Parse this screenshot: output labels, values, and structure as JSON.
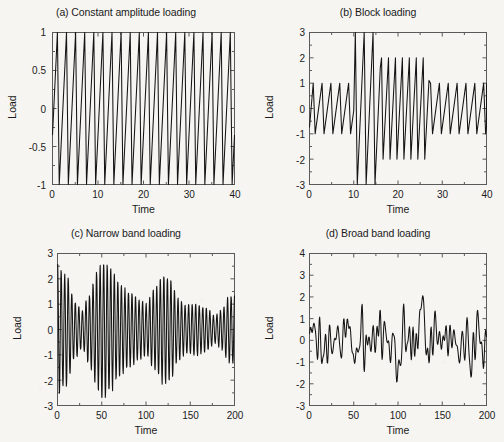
{
  "figure": {
    "background_color": "#f6f5f2",
    "line_color": "#141414",
    "axis_color": "#5a5a5a",
    "panel_count": 4
  },
  "chart_data": [
    {
      "type": "line",
      "panel": "a",
      "title": "(a) Constant amplitude loading",
      "xlabel": "Time",
      "ylabel": "Load",
      "xlim": [
        0,
        40
      ],
      "ylim": [
        -1,
        1
      ],
      "xticks": [
        0,
        10,
        20,
        30,
        40
      ],
      "yticks": [
        -1,
        -0.5,
        0,
        0.5,
        1
      ],
      "xticklabels": [
        "0",
        "10",
        "20",
        "30",
        "40"
      ],
      "yticklabels": [
        "-1",
        "-0.5",
        "0",
        "0.5",
        "1"
      ],
      "grid": false,
      "legend": null,
      "waveform": "sawtooth",
      "amplitude": 1,
      "period": 2,
      "cycles": 20,
      "description": "Constant amplitude asymmetric sawtooth oscillating between -1 and 1 with period 2 over 0 to 40."
    },
    {
      "type": "line",
      "panel": "b",
      "title": "(b) Block loading",
      "xlabel": "Time",
      "ylabel": "Load",
      "xlim": [
        0,
        40
      ],
      "ylim": [
        -3,
        3
      ],
      "xticks": [
        0,
        10,
        20,
        30,
        40
      ],
      "yticks": [
        -3,
        -2,
        -1,
        0,
        1,
        2,
        3
      ],
      "xticklabels": [
        "0",
        "10",
        "20",
        "30",
        "40"
      ],
      "yticklabels": [
        "-3",
        "-2",
        "-1",
        "0",
        "1",
        "2",
        "3"
      ],
      "grid": false,
      "legend": null,
      "waveform": "sawtooth-blocks",
      "blocks": [
        {
          "t_start": 0,
          "t_end": 10,
          "amplitude": 1,
          "period": 2.0,
          "cycles": 5
        },
        {
          "t_start": 10,
          "t_end": 16,
          "amplitude": 3,
          "period": 2.0,
          "cycles": 3
        },
        {
          "t_start": 16,
          "t_end": 27,
          "amplitude": 2,
          "period": 1.57,
          "cycles": 7
        },
        {
          "t_start": 27,
          "t_end": 40,
          "amplitude": 1,
          "period": 2.0,
          "cycles": 6.5
        }
      ],
      "description": "Block loading: amplitude 1 block, then amplitude 3 block, then amplitude 2 block, then amplitude 1 block."
    },
    {
      "type": "line",
      "panel": "c",
      "title": "(c) Narrow band loading",
      "xlabel": "Time",
      "ylabel": "Load",
      "xlim": [
        0,
        200
      ],
      "ylim": [
        -3,
        3
      ],
      "xticks": [
        0,
        50,
        100,
        150,
        200
      ],
      "yticks": [
        -3,
        -2,
        -1,
        0,
        1,
        2,
        3
      ],
      "xticklabels": [
        "0",
        "50",
        "100",
        "150",
        "200"
      ],
      "yticklabels": [
        "-3",
        "-2",
        "-1",
        "0",
        "1",
        "2",
        "3"
      ],
      "grid": false,
      "legend": null,
      "waveform": "narrow-band-random",
      "carrier_period": 4.0,
      "peak_max": 2.7,
      "peak_min": -2.75,
      "envelope_samples": [
        {
          "t": 0,
          "a": 2.5
        },
        {
          "t": 10,
          "a": 2.2
        },
        {
          "t": 20,
          "a": 1.1
        },
        {
          "t": 28,
          "a": 0.75
        },
        {
          "t": 35,
          "a": 1.3
        },
        {
          "t": 45,
          "a": 2.3
        },
        {
          "t": 52,
          "a": 2.7
        },
        {
          "t": 60,
          "a": 2.4
        },
        {
          "t": 70,
          "a": 1.8
        },
        {
          "t": 80,
          "a": 1.5
        },
        {
          "t": 92,
          "a": 1.2
        },
        {
          "t": 100,
          "a": 1.0
        },
        {
          "t": 110,
          "a": 1.6
        },
        {
          "t": 120,
          "a": 2.15
        },
        {
          "t": 128,
          "a": 1.95
        },
        {
          "t": 136,
          "a": 1.2
        },
        {
          "t": 146,
          "a": 0.95
        },
        {
          "t": 158,
          "a": 1.0
        },
        {
          "t": 168,
          "a": 0.85
        },
        {
          "t": 178,
          "a": 0.55
        },
        {
          "t": 186,
          "a": 0.8
        },
        {
          "t": 194,
          "a": 1.3
        },
        {
          "t": 200,
          "a": 1.4
        }
      ],
      "description": "Narrow band random loading: constant-frequency carrier with slowly varying beat envelope between about 0.5 and 2.7."
    },
    {
      "type": "line",
      "panel": "d",
      "title": "(d) Broad band loading",
      "xlabel": "Time",
      "ylabel": "Load",
      "xlim": [
        0,
        200
      ],
      "ylim": [
        -3,
        4
      ],
      "xticks": [
        0,
        50,
        100,
        150,
        200
      ],
      "yticks": [
        -3,
        -2,
        -1,
        0,
        1,
        2,
        3,
        4
      ],
      "xticklabels": [
        "0",
        "50",
        "100",
        "150",
        "200"
      ],
      "yticklabels": [
        "-3",
        "-2",
        "-1",
        "0",
        "1",
        "2",
        "3",
        "4"
      ],
      "grid": false,
      "legend": null,
      "waveform": "broad-band-random",
      "peak_max": 3.6,
      "peak_min": -2.55,
      "peak_max_time": 128,
      "peak_min_time": 100,
      "description": "Broad band random loading: irregular multi-frequency signal, mostly between -2 and 2 with a large positive spike near t = 128."
    }
  ]
}
